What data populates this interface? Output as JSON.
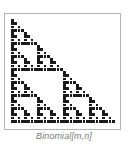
{
  "figure": {
    "caption": "Binomial[m,n]",
    "grid_size": 32,
    "modulus": 2,
    "cell_color": "#1a1a1a",
    "frame_color": "#b4b4b4",
    "caption_color": "#7a7a7a"
  }
}
